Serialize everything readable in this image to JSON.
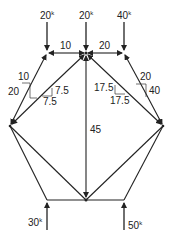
{
  "diagram": {
    "type": "truss free-body diagram",
    "joints": {
      "TL": [
        47,
        53
      ],
      "TC": [
        86,
        53
      ],
      "TR": [
        124,
        53
      ],
      "L": [
        10,
        126
      ],
      "R": [
        163,
        126
      ],
      "BL": [
        47,
        200
      ],
      "BC": [
        86,
        200
      ],
      "BR": [
        124,
        200
      ]
    },
    "applied_loads": [
      {
        "label": "20",
        "unit": "k",
        "joint": "TL",
        "direction": "down"
      },
      {
        "label": "20",
        "unit": "k",
        "joint": "TC",
        "direction": "down"
      },
      {
        "label": "40",
        "unit": "k",
        "joint": "TR",
        "direction": "down"
      }
    ],
    "reactions": [
      {
        "label": "30",
        "unit": "k",
        "joint": "BL",
        "direction": "up"
      },
      {
        "label": "50",
        "unit": "k",
        "joint": "BR",
        "direction": "up"
      }
    ],
    "member_labels": {
      "top_left": "10",
      "top_right": "20",
      "left_diag_horizontal": "10",
      "left_diag_vertical": "20",
      "inner_left_vertical": "7.5",
      "inner_left_horizontal": "7.5",
      "inner_right_vertical": "17.5",
      "inner_right_horizontal": "17.5",
      "right_diag_horizontal": "20",
      "right_diag_vertical": "40",
      "center_vertical": "45"
    }
  }
}
